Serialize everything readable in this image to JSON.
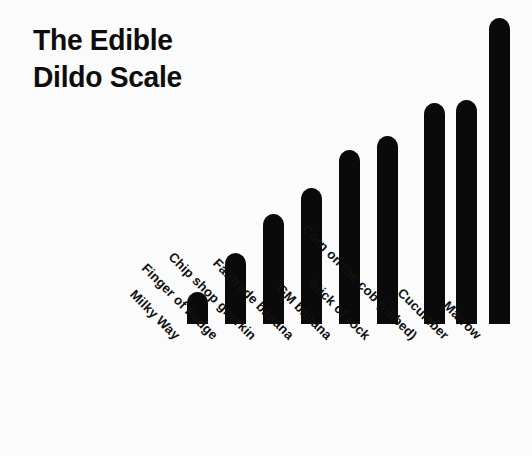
{
  "figure": {
    "title": "The Edible\nDildo Scale",
    "title_line_1": "The Edible",
    "title_line_2": "Dildo Scale",
    "background_color": "#fbfbfb",
    "bar_color": "#0a0a0a",
    "text_color": "#111111",
    "label_rotation_degrees": -45
  },
  "chart_data": {
    "type": "bar",
    "title": "The Edible Dildo Scale",
    "xlabel": "",
    "ylabel": "",
    "categories": [
      "Milky Way",
      "Finger of Fudge",
      "Chip shop gherkin",
      "Fairtrade banana",
      "GM banana",
      "Stick of rock",
      "Corn on the cob (ribbed)",
      "Cucumber",
      "Marrow"
    ],
    "values": [
      32,
      71,
      110,
      136,
      174,
      188,
      221,
      224,
      306
    ],
    "ylim": [
      0,
      310
    ],
    "grid": false,
    "legend": false,
    "axis_visible": false,
    "tick_labels_y": []
  },
  "bars": [
    {
      "label": "Milky Way",
      "value": 32,
      "x": 187,
      "top": 292
    },
    {
      "label": "Finger of Fudge",
      "value": 71,
      "x": 225,
      "top": 253
    },
    {
      "label": "Chip shop gherkin",
      "value": 110,
      "x": 263,
      "top": 214
    },
    {
      "label": "Fairtrade banana",
      "value": 136,
      "x": 301,
      "top": 188
    },
    {
      "label": "GM banana",
      "value": 174,
      "x": 339,
      "top": 150
    },
    {
      "label": "Stick of rock",
      "value": 188,
      "x": 377,
      "top": 136
    },
    {
      "label": "Corn on the cob (ribbed)",
      "value": 221,
      "x": 424,
      "top": 103
    },
    {
      "label": "Cucumber",
      "value": 224,
      "x": 456,
      "top": 100
    },
    {
      "label": "Marrow",
      "value": 306,
      "x": 489,
      "top": 18
    }
  ],
  "baseline_y": 324
}
